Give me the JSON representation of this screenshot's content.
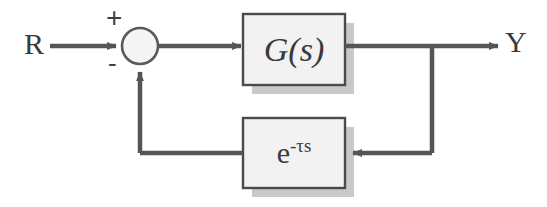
{
  "diagram": {
    "type": "control-system-block-diagram",
    "colors": {
      "background": "#ffffff",
      "line": "#555555",
      "block_stroke": "#4a4a4a",
      "block_fill": "#f2f2f2",
      "shadow": "#c9c9c9",
      "text": "#3a3a3a"
    },
    "signals": {
      "input_label": "R",
      "output_label": "Y"
    },
    "summing_junction": {
      "name": "summing-junction",
      "shape": "circle",
      "cx": 140,
      "cy": 46,
      "r": 18,
      "plus_sign": "+",
      "minus_sign": "-"
    },
    "blocks": [
      {
        "id": "plant",
        "label": "G(s)",
        "x": 243,
        "y": 14,
        "width": 102,
        "height": 71
      },
      {
        "id": "delay",
        "label": "e-τs",
        "base": "e",
        "exponent": "-τs",
        "x": 243,
        "y": 118,
        "width": 102,
        "height": 70
      }
    ],
    "connections": [
      {
        "id": "input-to-sum",
        "from": "R",
        "to": "summing-junction",
        "direction": "right"
      },
      {
        "id": "sum-to-plant",
        "from": "summing-junction",
        "to": "plant",
        "direction": "right"
      },
      {
        "id": "plant-to-output",
        "from": "plant",
        "to": "Y",
        "direction": "right"
      },
      {
        "id": "output-branch-down",
        "from": "output-tap",
        "to": "feedback-path",
        "direction": "down"
      },
      {
        "id": "feedback-to-delay",
        "from": "feedback-path",
        "to": "delay",
        "direction": "left"
      },
      {
        "id": "delay-to-sum",
        "from": "delay",
        "to": "summing-junction",
        "direction": "left-then-up"
      }
    ]
  }
}
